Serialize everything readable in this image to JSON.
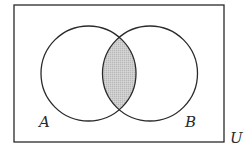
{
  "diagram": {
    "type": "venn",
    "universe": {
      "label": "U",
      "rect": {
        "x": 14,
        "y": 5,
        "width": 210,
        "height": 137
      }
    },
    "sets": [
      {
        "label": "A",
        "cx": 88.5,
        "cy": 73.5,
        "r": 47.5,
        "label_pos": {
          "x": 39,
          "y": 127
        }
      },
      {
        "label": "B",
        "cx": 150,
        "cy": 73.5,
        "r": 47.5,
        "label_pos": {
          "x": 185,
          "y": 127
        }
      }
    ],
    "shaded_region": "A ∩ B",
    "colors": {
      "stroke": "#2a2a2a",
      "shade": "#c9c9c9",
      "background": "#ffffff"
    }
  }
}
